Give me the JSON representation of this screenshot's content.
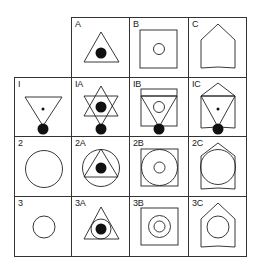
{
  "grid": {
    "columns": [
      "",
      "A",
      "B",
      "C"
    ],
    "rows": [
      "",
      "1",
      "2",
      "3"
    ]
  },
  "cells": {
    "A": {
      "label": "A",
      "description": "triangle with filled dot inside"
    },
    "B": {
      "label": "B",
      "description": "square with small circle inside"
    },
    "C": {
      "label": "C",
      "description": "pointed arch (shield) shape"
    },
    "1": {
      "label": "I",
      "description": "inverted triangle with center dot and filled circle at bottom vertex"
    },
    "1A": {
      "label": "IA",
      "description": "hexagram with filled dot center and filled circle at bottom"
    },
    "1B": {
      "label": "IB",
      "description": "square with inverted triangle, small circle and filled circle at bottom"
    },
    "1C": {
      "label": "IC",
      "description": "arch shape with inverted triangle, center dot and filled circle at bottom"
    },
    "2": {
      "label": "2",
      "description": "large circle"
    },
    "2A": {
      "label": "2A",
      "description": "circle with inscribed triangle and filled dot"
    },
    "2B": {
      "label": "2B",
      "description": "square with inscribed circle and small inner circle"
    },
    "2C": {
      "label": "2C",
      "description": "arch shape with inscribed circle"
    },
    "3": {
      "label": "3",
      "description": "small circle"
    },
    "3A": {
      "label": "3A",
      "description": "triangle with circle and filled dot"
    },
    "3B": {
      "label": "3B",
      "description": "square with concentric circles"
    },
    "3C": {
      "label": "3C",
      "description": "arch shape with circle inside"
    }
  },
  "colors": {
    "stroke": "#222222",
    "fill": "#111111",
    "background": "#ffffff"
  }
}
